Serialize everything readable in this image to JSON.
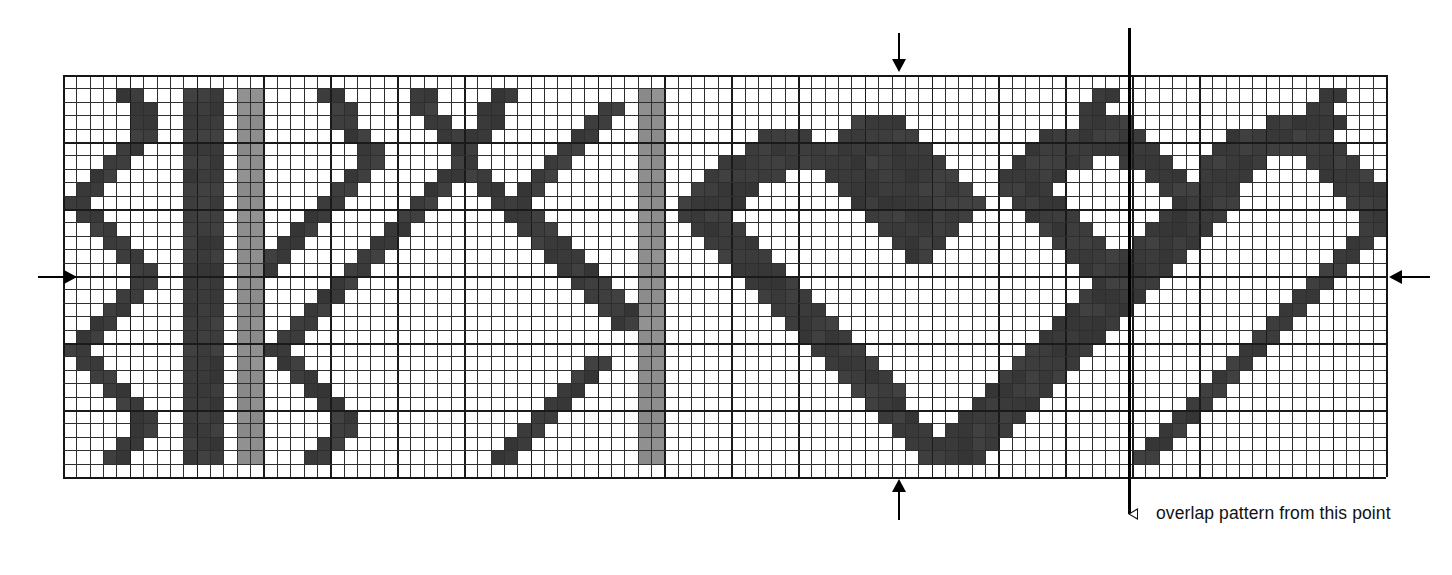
{
  "document": {
    "title": "Weave pattern draft",
    "kind": "pixel-grid pattern chart"
  },
  "caption": {
    "marker_glyph": "◁",
    "text": "overlap pattern from this point"
  },
  "markers": {
    "top_arrow": "centre-registration-arrow-top",
    "bottom_arrow": "centre-registration-arrow-bottom",
    "left_arrow": "centre-registration-arrow-left",
    "right_arrow": "centre-registration-arrow-right",
    "repeat_line": "repeat-start-line"
  },
  "colors": {
    "background": "#ffffff",
    "dark": "#3b3b3b",
    "mid_gray": "#8e8e8e",
    "light_gray": "#b3b3b3",
    "gridline": "#2e2e2e",
    "heavy_gridline": "#1a1a1a",
    "marker": "#000000"
  },
  "grid": {
    "columns": 99,
    "rows": 30,
    "heavy_every": 5,
    "cell_px": 13.36,
    "origin_x": 63,
    "origin_y": 75,
    "width": 1323,
    "height": 402,
    "repeat_line_column": 80,
    "top_arrow_column": 62,
    "bottom_arrow_column": 62,
    "left_arrow_row": 15,
    "right_arrow_row": 15
  },
  "chart_data": {
    "type": "heatmap",
    "xlabel": "",
    "ylabel": "",
    "legend": [
      {
        "key": "0",
        "label": "ground / empty",
        "color": "#ffffff"
      },
      {
        "key": "1",
        "label": "dark float",
        "color": "#3b3b3b"
      },
      {
        "key": "2",
        "label": "mid grey float",
        "color": "#8e8e8e"
      },
      {
        "key": "3",
        "label": "light grey float",
        "color": "#b3b3b3"
      }
    ],
    "ncols": 99,
    "nrows": 30,
    "encoding": "each row is a string of 99 digits; 0=white, 1=dark, 2=mid grey, 3=light grey",
    "rows": [
      "000000000000000000000000000000000000000000000000000000000000000000000000000000000000000000000000000",
      "000011000111022000011000001100001100000000022000000000000000000000000000000001100000000000000011000",
      "000001100111022000001100001100011000000011022000000000000000000000000000000011000000000000000110000",
      "000001100111022000001100000110011000000110022000000000000001111000000000000011110000000000111111000",
      "000001100111022000000110000011110000001100022000000011110011111100000000011111111000000111111110000",
      "000011000111022000000011000001100000011000022000000111111111111110000000111111111100001111111111000",
      "000110000111022000000011000001100000110000022000011111111111111111000001111110011110011111000111100",
      "001100000111022000000110000011110001100000022000111111000111111111100011111000000111011110000011110",
      "011000000111022000001100000110011011000000022001111100000011111111110011110000000011111100000001111",
      "110000000111022000011000001100001110000000022011111000000001111111111001111000000001111100000000111",
      "011000000111022000110000011000000111000000022011110000000000111111110000111100000011111000000000011",
      "001100000111022001100000110000000011100000022001111000000000011111100000011110000111110000000000011",
      "000110000111022011000001100000000001110000022000111100000000001111000000001111001111100000000000110",
      "000011000111022110000011000000000000111000022000011110000000000110000000000111111111000000000001100",
      "000001100111022100000110000000000000011100022000001111000000000000000000000011111110000000000011000",
      "000001100111022000001100000000000000001110022000000111100000000000000000000001111100000000000110000",
      "000011000111022000011000000000000000000111022000000011110000000000000000000011111000000000001100000",
      "000110000111022000110000000000000000000011122000000001111000000000000000000111110000000000011000000",
      "001100000111022001100000000000000000000001122000000000111100000000000000001111100000000000110000000",
      "011000000111022011000000000000000000000000022000000000011110000000000000011111000000000001100000000",
      "110000000111022110000000000000000000000000022000000000001111000000000000111110000000000011000000000",
      "011000000111022011000000000000000000000110022000000000000111100000000001111100000000000110000000000",
      "001100000111022001100000000000000000001100022000000000000011110000000011111000000000001100000000000",
      "000110000111022000110000000000000000011000022000000000000001111000000111110000000000011000000000000",
      "000011000111022000011000000000000000110000022000000000000000111000001111100000000000110000000000000",
      "000001100111022000001100000000000001100000022000000000000000011100011111000000000001100000000000000",
      "000001100111022000001100000000000011000000022000000000000000001110111110000000000011000000000000000",
      "000011000111022000011000000000000110000000022000000000000000000111111100000000000110000000000000000",
      "000110000111022000110000000000001100000000022000000000000000000011111000000000001100000000000000000",
      "000000000000000000000000000000000000000000000000000000000000000000000000000000000000000000000000000"
    ]
  }
}
